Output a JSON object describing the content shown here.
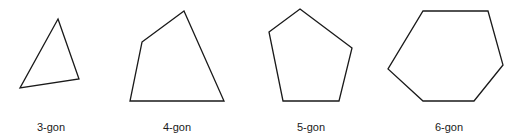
{
  "diagram": {
    "stroke_color": "#1a1a1a",
    "fill_color": "#ffffff",
    "stroke_width": 1.3,
    "polygons": [
      {
        "label": "3-gon",
        "sides": 3,
        "points": "58,19 79,79 20,88",
        "label_x": 51
      },
      {
        "label": "4-gon",
        "sides": 4,
        "points": "142,42 184,11 224,101 130,101",
        "label_x": 177
      },
      {
        "label": "5-gon",
        "sides": 5,
        "points": "300,9 352,48 339,101 283,101 269,32",
        "label_x": 311
      },
      {
        "label": "6-gon",
        "sides": 6,
        "points": "423,11 488,11 503,65 474,101 423,101 388,69",
        "label_x": 449
      }
    ]
  }
}
